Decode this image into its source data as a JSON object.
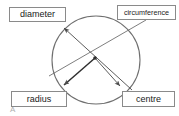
{
  "figure": {
    "corner_marker": "A",
    "cropped_top_text": "",
    "colors": {
      "stroke": "#6f6f6f",
      "label_border": "#8a8a8a",
      "text": "#1a1a1a",
      "background": "#ffffff",
      "marker": "#b0b0b0"
    }
  },
  "labels": {
    "diameter": "diameter",
    "circumference": "circumference",
    "radius": "radius",
    "centre": "centre"
  },
  "geometry": {
    "circle": {
      "cx": 96,
      "cy": 60,
      "r": 44
    },
    "centre_dot": {
      "x": 95,
      "y": 58,
      "r": 1.8
    },
    "diameter_line": {
      "x1": 64,
      "y1": 28,
      "x2": 132,
      "y2": 90,
      "arrow": "start"
    },
    "radius_line": {
      "x1": 95,
      "y1": 58,
      "x2": 63,
      "y2": 86,
      "arrow": "end"
    },
    "centre_pointer": {
      "x1": 95,
      "y1": 58,
      "x2": 121,
      "y2": 87,
      "arrow": "end"
    },
    "circumference_leader": {
      "x1": 146,
      "y1": 20,
      "x2": 49,
      "y2": 76,
      "arrow": "none"
    }
  }
}
